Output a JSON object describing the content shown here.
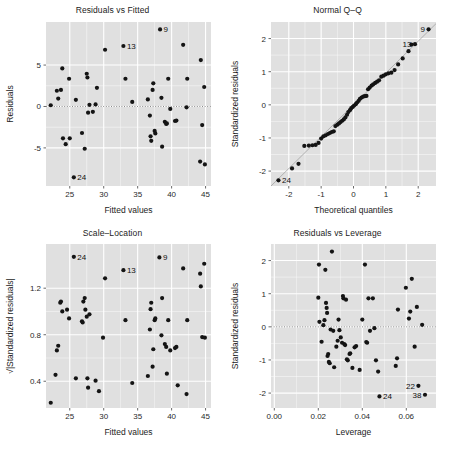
{
  "figure": {
    "kind": "regression-diagnostic-panel",
    "rows": 2,
    "cols": 2,
    "panel_fill": "#e0e0e0",
    "grid_color": "#ffffff",
    "point_color": "#141414",
    "reference_line_color": "#9a9a9a",
    "background": "#ffffff"
  },
  "charts": [
    {
      "id": "residuals-vs-fitted",
      "type": "scatter",
      "title": "Residuals vs Fitted",
      "xlabel": "Fitted values",
      "ylabel": "Residuals",
      "xlim": [
        21.5,
        45.8
      ],
      "ylim": [
        -9.6,
        10.2
      ],
      "xticks": [
        25,
        30,
        35,
        40,
        45
      ],
      "yticks": [
        -5,
        0,
        5
      ],
      "grid": true,
      "hline": 0,
      "points": [
        [
          22.2,
          0.15
        ],
        [
          23.1,
          1.9
        ],
        [
          23.3,
          0.95
        ],
        [
          23.7,
          2.0
        ],
        [
          23.9,
          4.6
        ],
        [
          24.0,
          -3.85
        ],
        [
          24.4,
          -4.55
        ],
        [
          24.9,
          3.35
        ],
        [
          25.0,
          -3.85
        ],
        [
          25.6,
          -8.55
        ],
        [
          25.9,
          0.8
        ],
        [
          26.8,
          -3.2
        ],
        [
          27.2,
          -5.1
        ],
        [
          27.5,
          3.95
        ],
        [
          27.6,
          3.5
        ],
        [
          27.7,
          -0.75
        ],
        [
          27.9,
          0.2
        ],
        [
          28.4,
          -0.65
        ],
        [
          28.8,
          0.25
        ],
        [
          29.0,
          2.25
        ],
        [
          30.2,
          6.85
        ],
        [
          32.9,
          7.3
        ],
        [
          33.2,
          3.35
        ],
        [
          34.2,
          0.55
        ],
        [
          36.5,
          0.85
        ],
        [
          36.8,
          -1.1
        ],
        [
          36.9,
          -3.6
        ],
        [
          37.0,
          -4.15
        ],
        [
          37.2,
          2.0
        ],
        [
          37.3,
          2.8
        ],
        [
          37.5,
          -2.95
        ],
        [
          37.6,
          -3.25
        ],
        [
          38.3,
          9.3
        ],
        [
          38.5,
          1.05
        ],
        [
          38.6,
          -4.85
        ],
        [
          39.0,
          -1.85
        ],
        [
          39.2,
          -2.1
        ],
        [
          39.3,
          -2.05
        ],
        [
          39.5,
          3.35
        ],
        [
          39.8,
          -0.3
        ],
        [
          40.5,
          -1.75
        ],
        [
          40.7,
          -1.7
        ],
        [
          41.7,
          7.45
        ],
        [
          42.2,
          -0.1
        ],
        [
          42.3,
          3.35
        ],
        [
          44.2,
          -6.65
        ],
        [
          44.3,
          5.6
        ],
        [
          44.5,
          -2.25
        ],
        [
          44.8,
          2.35
        ],
        [
          44.9,
          -7.0
        ]
      ],
      "labeled_points": [
        {
          "label": "9",
          "x": 38.3,
          "y": 9.3
        },
        {
          "label": "13",
          "x": 32.9,
          "y": 7.3
        },
        {
          "label": "24",
          "x": 25.6,
          "y": -8.55
        }
      ]
    },
    {
      "id": "normal-qq",
      "type": "scatter",
      "title": "Normal Q–Q",
      "xlabel": "Theoretical quantiles",
      "ylabel": "Standardized residuals",
      "xlim": [
        -2.55,
        2.55
      ],
      "ylim": [
        -2.45,
        2.5
      ],
      "xticks": [
        -2,
        -1,
        0,
        1,
        2
      ],
      "yticks": [
        -2,
        -1,
        0,
        1,
        2
      ],
      "grid": true,
      "refline": {
        "x0": -2.55,
        "y0": -2.45,
        "x1": 2.55,
        "y1": 2.45
      },
      "points": [
        [
          -2.32,
          -2.28
        ],
        [
          -1.9,
          -1.92
        ],
        [
          -1.7,
          -1.78
        ],
        [
          -1.52,
          -1.24
        ],
        [
          -1.38,
          -1.23
        ],
        [
          -1.27,
          -1.22
        ],
        [
          -1.17,
          -1.21
        ],
        [
          -1.08,
          -1.15
        ],
        [
          -1.0,
          -1.02
        ],
        [
          -0.93,
          -0.95
        ],
        [
          -0.86,
          -0.92
        ],
        [
          -0.79,
          -0.88
        ],
        [
          -0.73,
          -0.85
        ],
        [
          -0.67,
          -0.82
        ],
        [
          -0.61,
          -0.8
        ],
        [
          -0.56,
          -0.64
        ],
        [
          -0.5,
          -0.6
        ],
        [
          -0.45,
          -0.56
        ],
        [
          -0.4,
          -0.52
        ],
        [
          -0.35,
          -0.48
        ],
        [
          -0.3,
          -0.44
        ],
        [
          -0.25,
          -0.38
        ],
        [
          -0.2,
          -0.3
        ],
        [
          -0.16,
          -0.22
        ],
        [
          -0.11,
          -0.16
        ],
        [
          -0.07,
          -0.1
        ],
        [
          -0.02,
          -0.06
        ],
        [
          0.02,
          -0.02
        ],
        [
          0.07,
          0.02
        ],
        [
          0.11,
          0.07
        ],
        [
          0.16,
          0.12
        ],
        [
          0.2,
          0.18
        ],
        [
          0.25,
          0.22
        ],
        [
          0.3,
          0.25
        ],
        [
          0.35,
          0.26
        ],
        [
          0.4,
          0.27
        ],
        [
          0.45,
          0.47
        ],
        [
          0.5,
          0.52
        ],
        [
          0.56,
          0.58
        ],
        [
          0.61,
          0.62
        ],
        [
          0.67,
          0.66
        ],
        [
          0.73,
          0.7
        ],
        [
          0.79,
          0.74
        ],
        [
          0.86,
          0.85
        ],
        [
          0.93,
          0.88
        ],
        [
          1.0,
          0.92
        ],
        [
          1.08,
          0.95
        ],
        [
          1.17,
          0.97
        ],
        [
          1.27,
          1.05
        ],
        [
          1.38,
          1.22
        ],
        [
          1.52,
          1.4
        ],
        [
          1.7,
          1.62
        ],
        [
          1.79,
          1.82
        ],
        [
          1.9,
          1.83
        ],
        [
          2.32,
          2.28
        ]
      ],
      "labeled_points": [
        {
          "label": "9",
          "x": 2.32,
          "y": 2.28
        },
        {
          "label": "13",
          "x": 1.9,
          "y": 1.83
        },
        {
          "label": "24",
          "x": -2.32,
          "y": -2.28
        }
      ]
    },
    {
      "id": "scale-location",
      "type": "scatter",
      "title": "Scale–Location",
      "xlabel": "Fitted values",
      "ylabel": "√|Standardized residuals|",
      "xlim": [
        21.5,
        45.8
      ],
      "ylim": [
        0.17,
        1.58
      ],
      "xticks": [
        25,
        30,
        35,
        40,
        45
      ],
      "yticks": [
        0.4,
        0.8,
        1.2
      ],
      "grid": true,
      "points": [
        [
          22.2,
          0.215
        ],
        [
          22.9,
          0.455
        ],
        [
          23.1,
          0.665
        ],
        [
          23.3,
          0.705
        ],
        [
          23.6,
          1.075
        ],
        [
          23.7,
          1.085
        ],
        [
          23.9,
          1.0
        ],
        [
          24.6,
          1.015
        ],
        [
          24.9,
          0.94
        ],
        [
          25.6,
          1.47
        ],
        [
          25.9,
          0.425
        ],
        [
          26.8,
          0.915
        ],
        [
          26.9,
          0.905
        ],
        [
          27.0,
          1.085
        ],
        [
          27.2,
          1.115
        ],
        [
          27.3,
          1.015
        ],
        [
          27.5,
          0.955
        ],
        [
          27.6,
          0.425
        ],
        [
          27.7,
          0.345
        ],
        [
          27.9,
          0.975
        ],
        [
          28.8,
          0.405
        ],
        [
          29.3,
          0.315
        ],
        [
          29.9,
          0.775
        ],
        [
          30.2,
          1.285
        ],
        [
          32.9,
          1.355
        ],
        [
          33.2,
          0.925
        ],
        [
          34.2,
          0.385
        ],
        [
          36.5,
          0.445
        ],
        [
          36.8,
          0.845
        ],
        [
          36.9,
          1.02
        ],
        [
          37.0,
          1.075
        ],
        [
          37.2,
          0.525
        ],
        [
          37.3,
          0.675
        ],
        [
          37.5,
          0.925
        ],
        [
          37.6,
          0.94
        ],
        [
          38.2,
          1.465
        ],
        [
          38.5,
          0.795
        ],
        [
          38.6,
          1.115
        ],
        [
          39.0,
          0.72
        ],
        [
          39.2,
          0.695
        ],
        [
          39.3,
          0.465
        ],
        [
          39.5,
          0.925
        ],
        [
          39.8,
          0.665
        ],
        [
          40.5,
          0.685
        ],
        [
          40.7,
          0.695
        ],
        [
          40.9,
          0.365
        ],
        [
          41.7,
          1.37
        ],
        [
          42.2,
          0.29
        ],
        [
          42.3,
          0.925
        ],
        [
          44.2,
          1.325
        ],
        [
          44.3,
          1.215
        ],
        [
          44.5,
          0.78
        ],
        [
          44.8,
          1.41
        ],
        [
          44.9,
          0.775
        ]
      ],
      "labeled_points": [
        {
          "label": "24",
          "x": 25.6,
          "y": 1.47
        },
        {
          "label": "9",
          "x": 38.2,
          "y": 1.465
        },
        {
          "label": "13",
          "x": 32.9,
          "y": 1.355
        }
      ]
    },
    {
      "id": "residuals-vs-leverage",
      "type": "scatter",
      "title": "Residuals vs Leverage",
      "xlabel": "Leverage",
      "ylabel": "Standardized residuals",
      "xlim": [
        -0.0015,
        0.0735
      ],
      "ylim": [
        -2.45,
        2.5
      ],
      "xticks": [
        0.0,
        0.02,
        0.04,
        0.06
      ],
      "xticklabels": [
        "0.00",
        "0.02",
        "0.04",
        "0.06"
      ],
      "yticks": [
        -2,
        -1,
        0,
        1,
        2
      ],
      "grid": true,
      "hline": 0,
      "points": [
        [
          0.02,
          0.88
        ],
        [
          0.0203,
          1.88
        ],
        [
          0.0205,
          0.15
        ],
        [
          0.0215,
          -0.45
        ],
        [
          0.0223,
          0.05
        ],
        [
          0.0228,
          0.2
        ],
        [
          0.0232,
          1.72
        ],
        [
          0.0235,
          0.72
        ],
        [
          0.0238,
          0.57
        ],
        [
          0.024,
          0.42
        ],
        [
          0.0242,
          -0.88
        ],
        [
          0.0245,
          -0.82
        ],
        [
          0.0248,
          -1.06
        ],
        [
          0.0252,
          -1.1
        ],
        [
          0.0256,
          -0.08
        ],
        [
          0.0262,
          2.27
        ],
        [
          0.0268,
          -0.12
        ],
        [
          0.0272,
          -1.22
        ],
        [
          0.0282,
          -0.6
        ],
        [
          0.0288,
          -0.42
        ],
        [
          0.0292,
          0.22
        ],
        [
          0.0296,
          -0.1
        ],
        [
          0.0302,
          -0.32
        ],
        [
          0.0308,
          -0.48
        ],
        [
          0.0312,
          0.93
        ],
        [
          0.0314,
          0.86
        ],
        [
          0.0318,
          -0.52
        ],
        [
          0.0322,
          -0.55
        ],
        [
          0.0326,
          0.82
        ],
        [
          0.033,
          -0.98
        ],
        [
          0.0334,
          -1.01
        ],
        [
          0.0342,
          -0.82
        ],
        [
          0.0345,
          -0.8
        ],
        [
          0.0355,
          -1.24
        ],
        [
          0.0365,
          -0.62
        ],
        [
          0.0372,
          -0.58
        ],
        [
          0.0388,
          -1.3
        ],
        [
          0.04,
          0.22
        ],
        [
          0.0412,
          1.88
        ],
        [
          0.0418,
          -0.46
        ],
        [
          0.0422,
          -0.48
        ],
        [
          0.0428,
          0.86
        ],
        [
          0.0435,
          -0.12
        ],
        [
          0.0448,
          0.86
        ],
        [
          0.0455,
          -0.04
        ],
        [
          0.0462,
          -1.01
        ],
        [
          0.0472,
          -1.35
        ],
        [
          0.0478,
          -2.1
        ],
        [
          0.0552,
          -1.18
        ],
        [
          0.0558,
          -0.95
        ],
        [
          0.0562,
          0.52
        ],
        [
          0.0598,
          1.18
        ],
        [
          0.0612,
          0.25
        ],
        [
          0.0618,
          0.46
        ],
        [
          0.0625,
          1.45
        ],
        [
          0.0638,
          -0.6
        ],
        [
          0.0648,
          0.6
        ],
        [
          0.0655,
          -1.78
        ],
        [
          0.0672,
          0.06
        ],
        [
          0.0685,
          -2.05
        ]
      ],
      "labeled_points": [
        {
          "label": "22",
          "x": 0.0655,
          "y": -1.78
        },
        {
          "label": "24",
          "x": 0.0478,
          "y": -2.1
        },
        {
          "label": "38",
          "x": 0.0685,
          "y": -2.05
        }
      ]
    }
  ]
}
